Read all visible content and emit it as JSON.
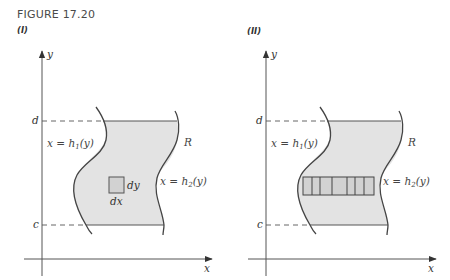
{
  "figure": {
    "title": "FIGURE 17.20",
    "colors": {
      "region_fill": "#e3e3e3",
      "element_fill": "#d2d2d2",
      "stroke": "#555555",
      "axis": "#555555",
      "text": "#444444"
    }
  },
  "panels": [
    {
      "label": "(I)",
      "axes": {
        "x_label": "x",
        "y_label": "y"
      },
      "bounds": {
        "upper": "d",
        "lower": "c"
      },
      "left_curve": {
        "eq_lhs": "x = h",
        "subscript": "1",
        "eq_rhs": "(y)"
      },
      "right_curve": {
        "eq_lhs": "x = h",
        "subscript": "2",
        "eq_rhs": "(y)"
      },
      "region_label": "R",
      "element": {
        "type": "rectangle",
        "width_label": "dx",
        "height_label": "dy"
      }
    },
    {
      "label": "(II)",
      "axes": {
        "x_label": "x",
        "y_label": "y"
      },
      "bounds": {
        "upper": "d",
        "lower": "c"
      },
      "left_curve": {
        "eq_lhs": "x = h",
        "subscript": "1",
        "eq_rhs": "(y)"
      },
      "right_curve": {
        "eq_lhs": "x = h",
        "subscript": "2",
        "eq_rhs": "(y)"
      },
      "region_label": "R",
      "element": {
        "type": "horizontal-strip",
        "cell_count": 7
      }
    }
  ]
}
